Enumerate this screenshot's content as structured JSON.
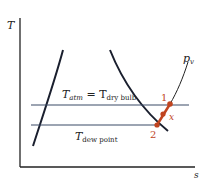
{
  "diagram": {
    "type": "T-s diagram",
    "axes": {
      "y_label": "T",
      "x_label": "s"
    },
    "lines": {
      "upper": {
        "label_main": "T",
        "label_sub": "atm",
        "equals": " = T",
        "equals_sub": "dry bulb"
      },
      "lower": {
        "label_main": "T",
        "label_sub": "dew point"
      }
    },
    "curve_label": {
      "main": "p",
      "sub": "v"
    },
    "points": [
      {
        "id": "1",
        "label": "1"
      },
      {
        "id": "x",
        "label": "x"
      },
      {
        "id": "2",
        "label": "2"
      }
    ],
    "colors": {
      "axis": "#222222",
      "dome": "#1a1f2e",
      "isotherm": "#3a4a66",
      "process": "#c0441f"
    }
  }
}
